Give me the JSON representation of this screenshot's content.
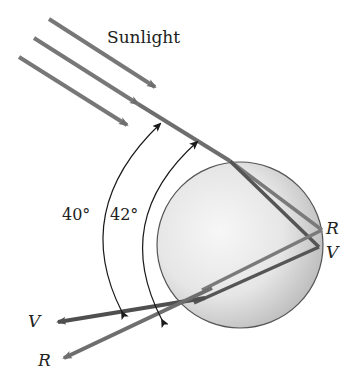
{
  "title": "Sunlight",
  "angles": {
    "outer": "40°",
    "inner": "42°"
  },
  "labels": {
    "internal_red": "R",
    "internal_violet": "V",
    "exit_violet": "V",
    "exit_red": "R"
  },
  "colors": {
    "ray": "#6e6e6e",
    "violet_ray": "#555555",
    "arc": "#1a1a1a",
    "sphere_edge": "#555555",
    "sphere_fill_light": "#f4f4f4",
    "sphere_fill_dark": "#bdbdbd"
  }
}
